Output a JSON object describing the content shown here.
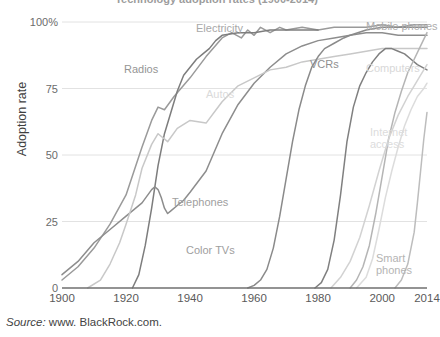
{
  "chart_data": {
    "type": "line",
    "title": "Technology adoption rates (1900-2014)",
    "xlabel": "",
    "ylabel": "Adoption rate",
    "xlim": [
      1900,
      2014
    ],
    "ylim": [
      0,
      100
    ],
    "xticks": [
      1900,
      1920,
      1940,
      1960,
      1980,
      2000,
      2014
    ],
    "yticks": [
      0,
      25,
      50,
      75,
      100
    ],
    "ytick_labels": [
      "0",
      "25",
      "50",
      "75",
      "100%"
    ],
    "grid": "horizontal",
    "legend": "inline-labels",
    "source": "www. BlackRock.com.",
    "source_prefix": "Source:",
    "series": [
      {
        "name": "Electricity",
        "color": "#9a9a9a",
        "label_x": 196,
        "label_y": 22,
        "label_color": "#a8a8a8",
        "points": [
          [
            1900,
            3
          ],
          [
            1905,
            8
          ],
          [
            1910,
            15
          ],
          [
            1915,
            24
          ],
          [
            1920,
            35
          ],
          [
            1925,
            53
          ],
          [
            1928,
            63
          ],
          [
            1930,
            68
          ],
          [
            1932,
            67
          ],
          [
            1935,
            72
          ],
          [
            1940,
            79
          ],
          [
            1945,
            87
          ],
          [
            1950,
            94
          ],
          [
            1953,
            96
          ],
          [
            1956,
            94
          ],
          [
            1958,
            97
          ],
          [
            1960,
            95
          ],
          [
            1962,
            98
          ],
          [
            1965,
            96
          ],
          [
            1968,
            98
          ],
          [
            1970,
            97
          ],
          [
            1975,
            98
          ],
          [
            1980,
            97
          ],
          [
            1985,
            98
          ],
          [
            1990,
            98
          ],
          [
            1995,
            98
          ],
          [
            2000,
            99
          ],
          [
            2005,
            98
          ],
          [
            2010,
            99
          ],
          [
            2014,
            99
          ]
        ]
      },
      {
        "name": "Radios",
        "color": "#7d7d7d",
        "label_x": 124,
        "label_y": 63,
        "label_color": "#959595",
        "points": [
          [
            1922,
            0
          ],
          [
            1924,
            5
          ],
          [
            1926,
            16
          ],
          [
            1928,
            30
          ],
          [
            1930,
            46
          ],
          [
            1932,
            58
          ],
          [
            1934,
            66
          ],
          [
            1936,
            74
          ],
          [
            1938,
            80
          ],
          [
            1940,
            83
          ],
          [
            1942,
            86
          ],
          [
            1944,
            88
          ],
          [
            1946,
            90
          ],
          [
            1948,
            93
          ],
          [
            1950,
            95
          ],
          [
            1955,
            96
          ],
          [
            1960,
            96
          ],
          [
            1965,
            97
          ],
          [
            1970,
            97
          ],
          [
            1975,
            97
          ],
          [
            1980,
            97
          ]
        ]
      },
      {
        "name": "Telephones",
        "color": "#8d8d8d",
        "label_x": 172,
        "label_y": 196,
        "label_color": "#a0a0a0",
        "points": [
          [
            1900,
            5
          ],
          [
            1905,
            10
          ],
          [
            1910,
            17
          ],
          [
            1915,
            22
          ],
          [
            1920,
            27
          ],
          [
            1925,
            32
          ],
          [
            1928,
            37
          ],
          [
            1929,
            38
          ],
          [
            1930,
            37
          ],
          [
            1931,
            34
          ],
          [
            1932,
            30
          ],
          [
            1933,
            28
          ],
          [
            1934,
            29
          ],
          [
            1936,
            31
          ],
          [
            1938,
            33
          ],
          [
            1940,
            36
          ],
          [
            1945,
            44
          ],
          [
            1950,
            58
          ],
          [
            1955,
            69
          ],
          [
            1960,
            77
          ],
          [
            1965,
            83
          ],
          [
            1970,
            88
          ],
          [
            1975,
            91
          ],
          [
            1980,
            93
          ],
          [
            1985,
            94
          ],
          [
            1990,
            95
          ],
          [
            1995,
            96
          ],
          [
            2000,
            96
          ],
          [
            2005,
            95
          ],
          [
            2010,
            95
          ],
          [
            2014,
            95
          ]
        ]
      },
      {
        "name": "Autos",
        "color": "#c8c8c8",
        "label_x": 206,
        "label_y": 88,
        "label_color": "#dadada",
        "points": [
          [
            1908,
            0
          ],
          [
            1912,
            3
          ],
          [
            1915,
            9
          ],
          [
            1918,
            17
          ],
          [
            1920,
            24
          ],
          [
            1923,
            35
          ],
          [
            1925,
            45
          ],
          [
            1928,
            54
          ],
          [
            1930,
            58
          ],
          [
            1933,
            55
          ],
          [
            1936,
            60
          ],
          [
            1940,
            63
          ],
          [
            1945,
            62
          ],
          [
            1950,
            70
          ],
          [
            1955,
            76
          ],
          [
            1960,
            79
          ],
          [
            1965,
            82
          ],
          [
            1970,
            83
          ],
          [
            1975,
            85
          ],
          [
            1980,
            86
          ],
          [
            1985,
            87
          ],
          [
            1990,
            88
          ],
          [
            1995,
            89
          ],
          [
            2000,
            90
          ],
          [
            2005,
            90
          ],
          [
            2010,
            90
          ],
          [
            2014,
            90
          ]
        ]
      },
      {
        "name": "Color TVs",
        "color": "#8a8a8a",
        "label_x": 186,
        "label_y": 244,
        "label_color": "#9e9e9e",
        "points": [
          [
            1958,
            0
          ],
          [
            1960,
            1
          ],
          [
            1962,
            3
          ],
          [
            1964,
            7
          ],
          [
            1966,
            15
          ],
          [
            1968,
            27
          ],
          [
            1970,
            41
          ],
          [
            1972,
            55
          ],
          [
            1974,
            67
          ],
          [
            1976,
            76
          ],
          [
            1978,
            83
          ],
          [
            1980,
            87
          ],
          [
            1982,
            90
          ],
          [
            1985,
            92
          ],
          [
            1988,
            94
          ],
          [
            1990,
            95
          ],
          [
            1995,
            97
          ],
          [
            2000,
            98
          ],
          [
            2005,
            98
          ],
          [
            2010,
            98
          ],
          [
            2014,
            98
          ]
        ]
      },
      {
        "name": "VCRs",
        "color": "#808080",
        "label_x": 310,
        "label_y": 58,
        "label_color": "#8f8f8f",
        "points": [
          [
            1979,
            0
          ],
          [
            1981,
            2
          ],
          [
            1983,
            7
          ],
          [
            1985,
            18
          ],
          [
            1987,
            35
          ],
          [
            1989,
            55
          ],
          [
            1991,
            68
          ],
          [
            1993,
            76
          ],
          [
            1995,
            81
          ],
          [
            1997,
            85
          ],
          [
            1999,
            88
          ],
          [
            2001,
            90
          ],
          [
            2003,
            90
          ],
          [
            2005,
            89
          ],
          [
            2007,
            88
          ],
          [
            2009,
            86
          ],
          [
            2011,
            84
          ],
          [
            2014,
            82
          ]
        ]
      },
      {
        "name": "Mobile phones",
        "color": "#b5b5b5",
        "label_x": 366,
        "label_y": 20,
        "label_color": "#adadad",
        "points": [
          [
            1990,
            0
          ],
          [
            1992,
            3
          ],
          [
            1994,
            8
          ],
          [
            1996,
            16
          ],
          [
            1998,
            28
          ],
          [
            2000,
            42
          ],
          [
            2002,
            56
          ],
          [
            2004,
            66
          ],
          [
            2006,
            74
          ],
          [
            2008,
            81
          ],
          [
            2010,
            86
          ],
          [
            2012,
            91
          ],
          [
            2014,
            96
          ]
        ]
      },
      {
        "name": "Computers",
        "color": "#d2d2d2",
        "label_x": 366,
        "label_y": 62,
        "label_color": "#d8d8d8",
        "points": [
          [
            1984,
            0
          ],
          [
            1987,
            4
          ],
          [
            1990,
            10
          ],
          [
            1993,
            19
          ],
          [
            1996,
            31
          ],
          [
            1999,
            44
          ],
          [
            2002,
            56
          ],
          [
            2005,
            65
          ],
          [
            2008,
            72
          ],
          [
            2010,
            76
          ],
          [
            2012,
            80
          ],
          [
            2014,
            84
          ]
        ]
      },
      {
        "name": "Internet access",
        "color": "#dcdcdc",
        "label_x": 370,
        "label_y": 126,
        "label_color": "#dcdcdc",
        "points": [
          [
            1992,
            0
          ],
          [
            1995,
            4
          ],
          [
            1997,
            11
          ],
          [
            1999,
            22
          ],
          [
            2001,
            34
          ],
          [
            2003,
            44
          ],
          [
            2005,
            53
          ],
          [
            2007,
            61
          ],
          [
            2009,
            67
          ],
          [
            2011,
            72
          ],
          [
            2013,
            75
          ],
          [
            2014,
            77
          ]
        ]
      },
      {
        "name": "Smart phones",
        "color": "#bdbdbd",
        "label_x": 376,
        "label_y": 252,
        "label_color": "#b4b4b4",
        "points": [
          [
            2004,
            0
          ],
          [
            2006,
            3
          ],
          [
            2008,
            9
          ],
          [
            2010,
            21
          ],
          [
            2011,
            32
          ],
          [
            2012,
            44
          ],
          [
            2013,
            56
          ],
          [
            2014,
            66
          ]
        ]
      }
    ]
  }
}
